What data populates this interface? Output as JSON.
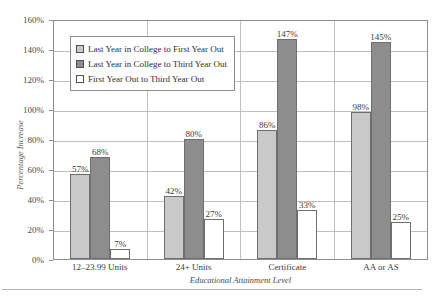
{
  "chart_data": {
    "type": "bar",
    "title": "",
    "xlabel": "Educational Attainment Level",
    "ylabel": "Percentage Increase",
    "categories": [
      "12–23.99 Units",
      "24+ Units",
      "Certificate",
      "AA or AS"
    ],
    "series": [
      {
        "name": "Last Year in College to First Year Out",
        "color": "#c9c9c9",
        "values": [
          57,
          42,
          86,
          98
        ],
        "labels": [
          "57%",
          "42%",
          "86%",
          "98%"
        ]
      },
      {
        "name": "Last Year in College to Third Year Out",
        "color": "#8d8d8d",
        "values": [
          68,
          80,
          147,
          145
        ],
        "labels": [
          "68%",
          "80%",
          "147%",
          "145%"
        ]
      },
      {
        "name": "First Year Out to Third Year Out",
        "color": "#ffffff",
        "values": [
          7,
          27,
          33,
          25
        ],
        "labels": [
          "7%",
          "27%",
          "33%",
          "25%"
        ]
      }
    ],
    "ylim": [
      0,
      160
    ],
    "ytick_values": [
      0,
      20,
      40,
      60,
      80,
      100,
      120,
      140,
      160
    ],
    "ytick_labels": [
      "0%",
      "20%",
      "40%",
      "60%",
      "80%",
      "100%",
      "120%",
      "140%",
      "160%"
    ],
    "grid": true,
    "legend_position": "upper-left-inside"
  },
  "figure": {
    "top_fragment": "",
    "source_fragment": ""
  }
}
